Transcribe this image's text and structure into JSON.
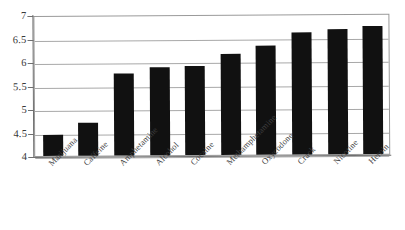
{
  "chart_data": {
    "type": "bar",
    "title": "",
    "subtitle": "",
    "xlabel": "",
    "ylabel": "",
    "ylim": [
      4,
      7
    ],
    "yticks": [
      "4",
      "4.5",
      "5",
      "5.5",
      "6",
      "6.5",
      "7"
    ],
    "grid": true,
    "legend": null,
    "orientation": "vertical",
    "bar_color": "#111111",
    "categories": [
      "Marijuana",
      "Caffeine",
      "Amphetamine",
      "Alcohol",
      "Cocaine",
      "Methamphetamine",
      "Oxycodone",
      "Crack",
      "Nicotine",
      "Heroin"
    ],
    "values": [
      4.45,
      4.7,
      5.75,
      5.88,
      5.9,
      6.15,
      6.32,
      6.6,
      6.65,
      6.72
    ],
    "series": [
      {
        "name": "",
        "values": [
          4.45,
          4.7,
          5.75,
          5.88,
          5.9,
          6.15,
          6.32,
          6.6,
          6.65,
          6.72
        ]
      }
    ]
  },
  "axes": {
    "y_tick_labels": [
      "7",
      "6.5",
      "6",
      "5.5",
      "5",
      "4.5",
      "4"
    ],
    "y_min": 4,
    "y_max": 7,
    "y_step": 0.5
  },
  "colors": {
    "bar": "#111111",
    "gridline": "#a8a8a8",
    "frame": "#9a9a9a",
    "axis": "#6f6f6f",
    "text": "#3a3a3a",
    "background": "#ffffff"
  }
}
